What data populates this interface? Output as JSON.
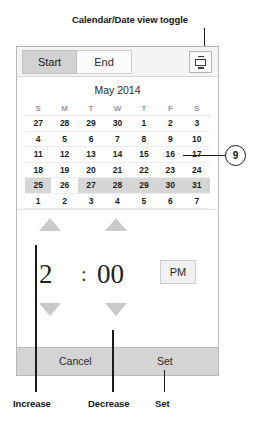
{
  "annotations": {
    "top_label": "Calendar/Date view toggle",
    "callout_number": "9",
    "bottom": [
      {
        "label": "Increase"
      },
      {
        "label": "Decrease"
      },
      {
        "label": "Set"
      }
    ]
  },
  "panel": {
    "tabs": [
      {
        "label": "Start",
        "selected": true
      },
      {
        "label": "End",
        "selected": false
      }
    ],
    "toggle_icon": "calendar-date-view-toggle-icon",
    "calendar": {
      "title": "May 2014",
      "weekdays": [
        "S",
        "M",
        "T",
        "W",
        "T",
        "F",
        "S"
      ],
      "weeks": [
        [
          {
            "d": "27",
            "muted": true
          },
          {
            "d": "28",
            "muted": true
          },
          {
            "d": "29",
            "muted": true
          },
          {
            "d": "30",
            "muted": true
          },
          {
            "d": "1",
            "muted": false
          },
          {
            "d": "2",
            "muted": false
          },
          {
            "d": "3",
            "muted": false
          }
        ],
        [
          {
            "d": "4",
            "muted": false
          },
          {
            "d": "5",
            "muted": false
          },
          {
            "d": "6",
            "muted": false
          },
          {
            "d": "7",
            "muted": false
          },
          {
            "d": "8",
            "muted": false
          },
          {
            "d": "9",
            "muted": false
          },
          {
            "d": "10",
            "muted": false
          }
        ],
        [
          {
            "d": "11",
            "muted": false
          },
          {
            "d": "12",
            "muted": false
          },
          {
            "d": "13",
            "muted": false
          },
          {
            "d": "14",
            "muted": false
          },
          {
            "d": "15",
            "muted": false
          },
          {
            "d": "16",
            "muted": false
          },
          {
            "d": "17",
            "muted": false
          }
        ],
        [
          {
            "d": "18",
            "muted": false
          },
          {
            "d": "19",
            "muted": false
          },
          {
            "d": "20",
            "muted": false
          },
          {
            "d": "21",
            "muted": false
          },
          {
            "d": "22",
            "muted": false
          },
          {
            "d": "23",
            "muted": false
          },
          {
            "d": "24",
            "muted": false
          }
        ],
        [
          {
            "d": "25",
            "muted": false
          },
          {
            "d": "26",
            "muted": false,
            "selected": true
          },
          {
            "d": "27",
            "muted": false
          },
          {
            "d": "28",
            "muted": false
          },
          {
            "d": "29",
            "muted": false
          },
          {
            "d": "30",
            "muted": false
          },
          {
            "d": "31",
            "muted": false
          }
        ],
        [
          {
            "d": "1",
            "muted": true
          },
          {
            "d": "2",
            "muted": true
          },
          {
            "d": "3",
            "muted": true
          },
          {
            "d": "4",
            "muted": true
          },
          {
            "d": "5",
            "muted": true
          },
          {
            "d": "6",
            "muted": true
          },
          {
            "d": "7",
            "muted": true
          }
        ]
      ],
      "selected_week_index": 4
    },
    "time": {
      "hour": "2",
      "separator": ":",
      "minute": "00",
      "meridiem": "PM"
    },
    "buttons": {
      "cancel": "Cancel",
      "set": "Set"
    }
  }
}
